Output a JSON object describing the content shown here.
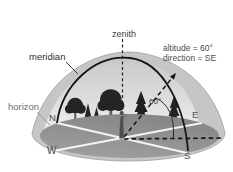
{
  "figure": {
    "type": "sky-dome-horizon-diagram",
    "labels": {
      "zenith": "zenith",
      "meridian": "meridian",
      "horizon": "horizon",
      "angle": "60°"
    },
    "annotation": {
      "line1": "altitude = 60°",
      "line2": "direction = SE"
    },
    "compass": {
      "north": "N",
      "east": "E",
      "south": "S",
      "west": "W"
    },
    "colors": {
      "dome_shell": "#c6c6c6",
      "sky_top": "#c6c6c6",
      "sky_horizon": "#f1f1f1",
      "ground": "#8f8f8f",
      "meridian_line": "#151515",
      "cardinal_lines": "#f4f4f4",
      "trees": "#242424",
      "label_text": "#3c3c3c"
    }
  }
}
